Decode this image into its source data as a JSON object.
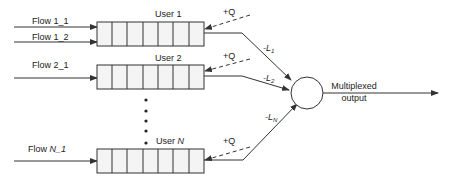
{
  "diagram": {
    "colors": {
      "stroke": "#333333",
      "cell_fill": "#f4f4f4",
      "text": "#222222"
    },
    "flows": [
      {
        "label": "Flow 1_1"
      },
      {
        "label": "Flow 1_2"
      },
      {
        "label": "Flow 2_1"
      },
      {
        "label_prefix": "Flow ",
        "label_italic": "N",
        "label_suffix": "_1"
      }
    ],
    "queues": [
      {
        "label": "User 1",
        "cells": 7,
        "feedback": "+Q",
        "link_prefix": "-L",
        "link_sub": "1"
      },
      {
        "label": "User 2",
        "cells": 7,
        "feedback": "+Q",
        "link_prefix": "-L",
        "link_sub": "2"
      },
      {
        "label_prefix": "User ",
        "label_italic": "N",
        "cells": 7,
        "feedback": "+Q",
        "link_prefix": "-L",
        "link_sub": "N"
      }
    ],
    "ellipsis": "vertical-dots",
    "multiplexer": {
      "shape": "circle"
    },
    "output": {
      "line1": "Multiplexed",
      "line2": "output"
    }
  }
}
